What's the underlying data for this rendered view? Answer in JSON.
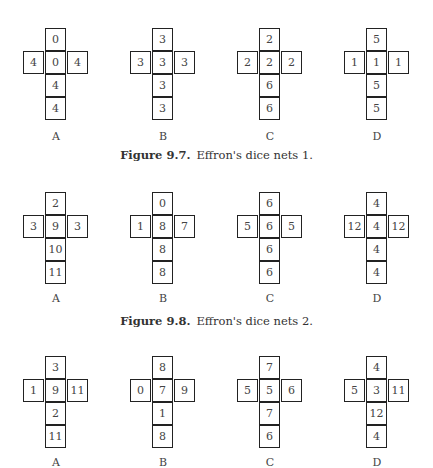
{
  "figures": [
    {
      "caption_label": "Figure 9.7.",
      "caption_text": "Effron's dice nets 1.",
      "nets": [
        {
          "label": "A",
          "top": "0",
          "left": "4",
          "center": "0",
          "right": "4",
          "below": "4",
          "bottom": "4"
        },
        {
          "label": "B",
          "top": "3",
          "left": "3",
          "center": "3",
          "right": "3",
          "below": "3",
          "bottom": "3"
        },
        {
          "label": "C",
          "top": "2",
          "left": "2",
          "center": "2",
          "right": "2",
          "below": "6",
          "bottom": "6"
        },
        {
          "label": "D",
          "top": "5",
          "left": "1",
          "center": "1",
          "right": "1",
          "below": "5",
          "bottom": "5"
        }
      ]
    },
    {
      "caption_label": "Figure 9.8.",
      "caption_text": "Effron's dice nets 2.",
      "nets": [
        {
          "label": "A",
          "top": "2",
          "left": "3",
          "center": "9",
          "right": "3",
          "below": "10",
          "bottom": "11"
        },
        {
          "label": "B",
          "top": "0",
          "left": "1",
          "center": "8",
          "right": "7",
          "below": "8",
          "bottom": "8"
        },
        {
          "label": "C",
          "top": "6",
          "left": "5",
          "center": "6",
          "right": "5",
          "below": "6",
          "bottom": "6"
        },
        {
          "label": "D",
          "top": "4",
          "left": "12",
          "center": "4",
          "right": "12",
          "below": "4",
          "bottom": "4"
        }
      ]
    },
    {
      "nets": [
        {
          "label": "A",
          "top": "3",
          "left": "1",
          "center": "9",
          "right": "11",
          "below": "2",
          "bottom": "11"
        },
        {
          "label": "B",
          "top": "8",
          "left": "0",
          "center": "7",
          "right": "9",
          "below": "1",
          "bottom": "8"
        },
        {
          "label": "C",
          "top": "7",
          "left": "5",
          "center": "5",
          "right": "6",
          "below": "7",
          "bottom": "6"
        },
        {
          "label": "D",
          "top": "4",
          "left": "5",
          "center": "3",
          "right": "11",
          "below": "12",
          "bottom": "4"
        }
      ]
    }
  ]
}
